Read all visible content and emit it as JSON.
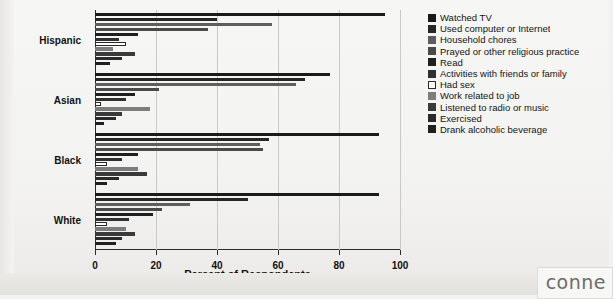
{
  "chart_data": {
    "type": "bar",
    "orientation": "horizontal",
    "title": "",
    "xlabel": "Percent of Respondents",
    "ylabel": "",
    "xlim": [
      0,
      100
    ],
    "xticks": [
      0,
      20,
      40,
      60,
      80,
      100
    ],
    "grid": true,
    "legend_position": "right",
    "categories": [
      "Hispanic",
      "Asian",
      "Black",
      "White"
    ],
    "series": [
      {
        "name": "Watched TV",
        "color": "#1a1a1a",
        "values": [
          95,
          77,
          93,
          93
        ]
      },
      {
        "name": "Used computer or Internet",
        "color": "#262626",
        "values": [
          40,
          69,
          57,
          50
        ]
      },
      {
        "name": "Household chores",
        "color": "#5e5e5e",
        "values": [
          58,
          66,
          54,
          31
        ]
      },
      {
        "name": "Prayed or other religious practice",
        "color": "#4a4a4a",
        "values": [
          37,
          21,
          55,
          22
        ]
      },
      {
        "name": "Read",
        "color": "#1f1f1f",
        "values": [
          14,
          13,
          14,
          19
        ]
      },
      {
        "name": "Activities with friends or family",
        "color": "#303030",
        "values": [
          8,
          10,
          9,
          11
        ]
      },
      {
        "name": "Had sex",
        "color": "#ffffff",
        "values": [
          10,
          2,
          4,
          4
        ]
      },
      {
        "name": "Work related to job",
        "color": "#7d7d7d",
        "values": [
          6,
          18,
          14,
          10
        ]
      },
      {
        "name": "Listened to radio or music",
        "color": "#3a3a3a",
        "values": [
          13,
          9,
          17,
          13
        ]
      },
      {
        "name": "Exercised",
        "color": "#2b2b2b",
        "values": [
          9,
          7,
          8,
          9
        ]
      },
      {
        "name": "Drank alcoholic beverage",
        "color": "#202020",
        "values": [
          5,
          3,
          4,
          7
        ]
      }
    ]
  },
  "axis": {
    "xlabel": "Percent of Respondents",
    "tick_labels": [
      "0",
      "20",
      "40",
      "60",
      "80",
      "100"
    ],
    "group_labels": [
      "Hispanic",
      "Asian",
      "Black",
      "White"
    ]
  },
  "legend": {
    "items": [
      {
        "label": "Watched TV",
        "swatch": "#1a1a1a"
      },
      {
        "label": "Used computer or Internet",
        "swatch": "#262626"
      },
      {
        "label": "Household chores",
        "swatch": "#5e5e5e"
      },
      {
        "label": "Prayed or other religious practice",
        "swatch": "#4a4a4a"
      },
      {
        "label": "Read",
        "swatch": "#1f1f1f"
      },
      {
        "label": "Activities with friends or family",
        "swatch": "#303030"
      },
      {
        "label": "Had sex",
        "swatch": "#ffffff"
      },
      {
        "label": "Work related to job",
        "swatch": "#7d7d7d"
      },
      {
        "label": "Listened to radio or music",
        "swatch": "#3a3a3a"
      },
      {
        "label": "Exercised",
        "swatch": "#2b2b2b"
      },
      {
        "label": "Drank alcoholic beverage",
        "swatch": "#202020"
      }
    ]
  },
  "watermark": {
    "text": "conne"
  }
}
